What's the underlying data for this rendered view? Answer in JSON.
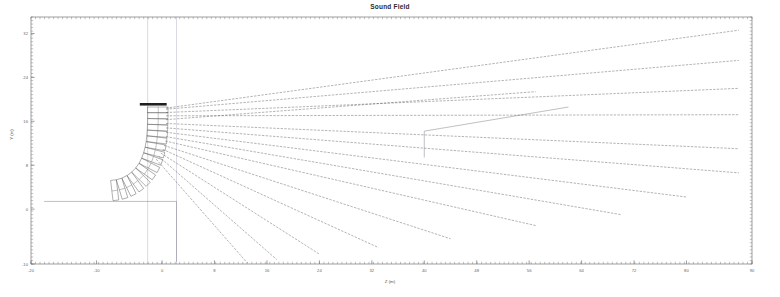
{
  "title": "Sound Field",
  "axes": {
    "xlabel": "Z (m)",
    "ylabel": "Y (m)",
    "xlim": [
      -20,
      90
    ],
    "ylim": [
      -10,
      35
    ],
    "xticks": [
      -20,
      -10,
      0,
      8,
      16,
      24,
      32,
      40,
      48,
      56,
      64,
      72,
      80,
      90
    ],
    "xtick_labels": [
      "-20",
      "-10",
      "0",
      "8",
      "16",
      "24",
      "32",
      "40",
      "48",
      "56",
      "64",
      "72",
      "80",
      "90"
    ],
    "yticks": [
      -10,
      0,
      8,
      16,
      24,
      32
    ],
    "ytick_labels": [
      "-10",
      "0",
      "8",
      "16",
      "24",
      "32"
    ],
    "grid": false,
    "frame_color": "#777777"
  },
  "chart_data": {
    "type": "line",
    "title": "Sound Field",
    "xlabel": "Z (m)",
    "ylabel": "Y (m)",
    "xlim": [
      -20,
      90
    ],
    "ylim": [
      -10,
      35
    ],
    "grid": false,
    "legend": "none",
    "series": [
      {
        "name": "array-frame-bar",
        "type": "polyline",
        "points": [
          [
            -3.4,
            19.1
          ],
          [
            0.7,
            19.1
          ]
        ]
      },
      {
        "name": "line-array-cabinets",
        "type": "boxes",
        "count": 16,
        "x_start": -2.2,
        "y_start": 18.6,
        "box_w": 3.1,
        "box_h": 1.05,
        "splay_deg": [
          0,
          0.5,
          0.8,
          1.2,
          1.8,
          2.5,
          3.4,
          4.4,
          5.6,
          7.0,
          8.2,
          9.0,
          9.4,
          9.6,
          9.8,
          10.0
        ]
      },
      {
        "name": "rays",
        "type": "multiline",
        "origin_x": 0.6,
        "lines": [
          {
            "from": [
              0.6,
              18.4
            ],
            "to": [
              88.0,
              32.6
            ]
          },
          {
            "from": [
              0.6,
              18.2
            ],
            "to": [
              88.0,
              27.1
            ]
          },
          {
            "from": [
              0.6,
              17.6
            ],
            "to": [
              88.0,
              22.0
            ]
          },
          {
            "from": [
              0.6,
              17.0
            ],
            "to": [
              88.0,
              17.2
            ]
          },
          {
            "from": [
              0.6,
              16.3
            ],
            "to": [
              57.0,
              21.4
            ]
          },
          {
            "from": [
              0.6,
              15.6
            ],
            "to": [
              88.0,
              11.0
            ]
          },
          {
            "from": [
              0.6,
              14.8
            ],
            "to": [
              88.0,
              6.6
            ]
          },
          {
            "from": [
              0.6,
              14.0
            ],
            "to": [
              80.0,
              2.2
            ]
          },
          {
            "from": [
              0.6,
              13.2
            ],
            "to": [
              70.0,
              -1.0
            ]
          },
          {
            "from": [
              0.5,
              12.4
            ],
            "to": [
              57.0,
              -3.0
            ]
          },
          {
            "from": [
              0.3,
              11.6
            ],
            "to": [
              44.0,
              -5.4
            ]
          },
          {
            "from": [
              0.1,
              10.9
            ],
            "to": [
              33.0,
              -7.0
            ]
          },
          {
            "from": [
              -0.2,
              10.2
            ],
            "to": [
              24.0,
              -8.2
            ]
          },
          {
            "from": [
              -0.5,
              9.6
            ],
            "to": [
              17.5,
              -9.2
            ]
          },
          {
            "from": [
              -0.9,
              9.1
            ],
            "to": [
              13.0,
              -9.8
            ]
          }
        ]
      },
      {
        "name": "stage-outline",
        "type": "polyline",
        "points": [
          [
            -18.0,
            1.4
          ],
          [
            2.2,
            1.4
          ],
          [
            2.2,
            -9.6
          ]
        ]
      },
      {
        "name": "balcony-riser",
        "type": "polyline",
        "points": [
          [
            40.0,
            9.4
          ],
          [
            40.0,
            14.2
          ],
          [
            62.0,
            18.6
          ]
        ]
      },
      {
        "name": "guide-line-a",
        "type": "vline",
        "x": -2.2
      },
      {
        "name": "guide-line-b",
        "type": "vline",
        "x": 2.2
      }
    ]
  },
  "colors": {
    "ray": "#4a4a4a",
    "cabinet": "#5a5a5a",
    "frame_bar": "#202020",
    "guide": "#b4b4c8",
    "structure": "#8a8a96",
    "axis": "#777777",
    "text": "#555555",
    "title": "#2b2b2b"
  }
}
